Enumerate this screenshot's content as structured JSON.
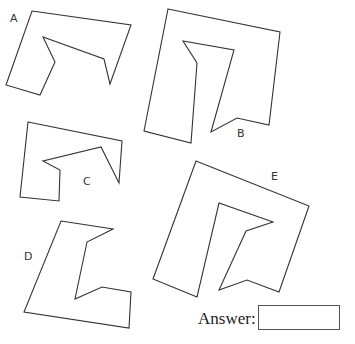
{
  "shapes": [
    {
      "label": "A",
      "label_pos": [
        10,
        12
      ],
      "points": [
        [
          32,
          11
        ],
        [
          131,
          25
        ],
        [
          110,
          84
        ],
        [
          104,
          59
        ],
        [
          43,
          37
        ],
        [
          55,
          62
        ],
        [
          40,
          95
        ],
        [
          6,
          85
        ]
      ]
    },
    {
      "label": "B",
      "label_pos": [
        237,
        127
      ],
      "points": [
        [
          168,
          9
        ],
        [
          280,
          32
        ],
        [
          269,
          125
        ],
        [
          237,
          118
        ],
        [
          211,
          132
        ],
        [
          234,
          50
        ],
        [
          183,
          41
        ],
        [
          197,
          63
        ],
        [
          191,
          143
        ],
        [
          144,
          131
        ]
      ]
    },
    {
      "label": "C",
      "label_pos": [
        83,
        175
      ],
      "points": [
        [
          28,
          122
        ],
        [
          122,
          141
        ],
        [
          119,
          183
        ],
        [
          101,
          147
        ],
        [
          43,
          161
        ],
        [
          60,
          170
        ],
        [
          59,
          201
        ],
        [
          20,
          197
        ]
      ]
    },
    {
      "label": "D",
      "label_pos": [
        24,
        250
      ],
      "points": [
        [
          61,
          221
        ],
        [
          113,
          229
        ],
        [
          87,
          242
        ],
        [
          75,
          299
        ],
        [
          102,
          287
        ],
        [
          131,
          292
        ],
        [
          129,
          328
        ],
        [
          24,
          312
        ]
      ]
    },
    {
      "label": "E",
      "label_pos": [
        271,
        170
      ],
      "points": [
        [
          196,
          161
        ],
        [
          309,
          206
        ],
        [
          279,
          292
        ],
        [
          247,
          280
        ],
        [
          219,
          290
        ],
        [
          246,
          231
        ],
        [
          273,
          222
        ],
        [
          219,
          203
        ],
        [
          197,
          297
        ],
        [
          153,
          279
        ]
      ]
    }
  ],
  "answer": {
    "label": "Answer:",
    "value": ""
  }
}
